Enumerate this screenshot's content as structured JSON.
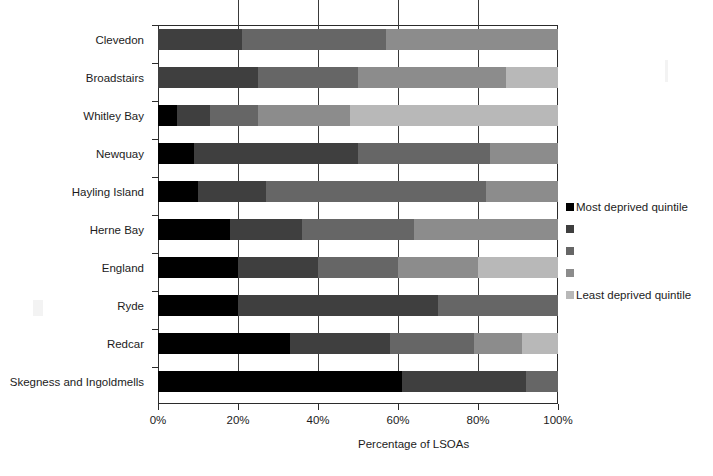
{
  "chart_data": {
    "type": "bar",
    "orientation": "horizontal",
    "stacked": true,
    "stack_mode": "percent",
    "title": "",
    "xlabel": "Percentage of LSOAs",
    "ylabel": "",
    "xlim": [
      0,
      100
    ],
    "xticks": [
      "0%",
      "20%",
      "40%",
      "60%",
      "80%",
      "100%"
    ],
    "xtick_values": [
      0,
      20,
      40,
      60,
      80,
      100
    ],
    "grid": "vertical gridlines at each 20% tick",
    "legend_position": "right, middle",
    "categories": [
      "Clevedon",
      "Broadstairs",
      "Whitley Bay",
      "Newquay",
      "Hayling Island",
      "Herne Bay",
      "England",
      "Ryde",
      "Redcar",
      "Skegness and Ingoldmells"
    ],
    "series": [
      {
        "name": "Most deprived quintile",
        "color": "#000000",
        "values": [
          0,
          0,
          4.8,
          9,
          10,
          18,
          20,
          20,
          33,
          61
        ]
      },
      {
        "name": "quintile 2",
        "color": "#3f3f3f",
        "values": [
          21,
          25,
          8.2,
          41,
          17,
          18,
          20,
          50,
          25,
          31
        ]
      },
      {
        "name": "quintile 3",
        "color": "#666666",
        "values": [
          36,
          25,
          12,
          33,
          55,
          28,
          20,
          30,
          21,
          8
        ]
      },
      {
        "name": "quintile 4",
        "color": "#8c8c8c",
        "values": [
          43,
          37,
          23,
          17,
          18,
          36,
          20,
          0,
          12,
          0
        ]
      },
      {
        "name": "Least deprived quintile",
        "color": "#b8b8b8",
        "values": [
          0,
          13,
          52,
          0,
          0,
          0,
          20,
          0,
          9,
          0
        ]
      }
    ],
    "cumulative_boundaries": {
      "Clevedon": [
        0,
        0,
        21,
        57,
        100,
        100
      ],
      "Broadstairs": [
        0,
        0,
        25,
        50,
        87,
        100
      ],
      "Whitley Bay": [
        0,
        4.8,
        13,
        25,
        48,
        100
      ],
      "Newquay": [
        0,
        9,
        50,
        83,
        100,
        100
      ],
      "Hayling Island": [
        0,
        10,
        27,
        82,
        100,
        100
      ],
      "Herne Bay": [
        0,
        18,
        36,
        64,
        100,
        100
      ],
      "England": [
        0,
        20,
        40,
        60,
        80,
        100
      ],
      "Ryde": [
        0,
        20,
        70,
        100,
        100,
        100
      ],
      "Redcar": [
        0,
        33,
        58,
        79,
        91,
        100
      ],
      "Skegness and Ingoldmells": [
        0,
        61,
        92,
        100,
        100,
        100
      ]
    }
  },
  "legend": {
    "entries": [
      {
        "label": "Most deprived quintile",
        "color": "#000000"
      },
      {
        "label": "",
        "color": "#3f3f3f"
      },
      {
        "label": "",
        "color": "#666666"
      },
      {
        "label": "",
        "color": "#8c8c8c"
      },
      {
        "label": "Least deprived quintile",
        "color": "#b8b8b8"
      }
    ]
  },
  "axis": {
    "x_title": "Percentage of LSOAs"
  },
  "colors": {
    "axis_line": "#2b2b2b",
    "gridline": "#3a3a3a",
    "plot_background": "#ffffff",
    "text": "#1c1c1c"
  }
}
